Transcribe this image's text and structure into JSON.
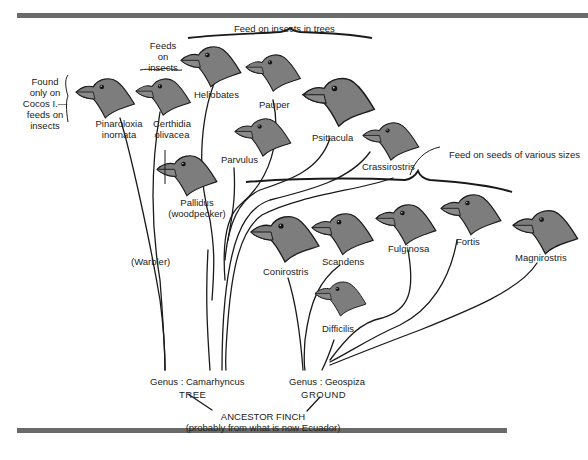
{
  "diagram": {
    "annotations": {
      "cocos": [
        "Found",
        "only on",
        "Cocos I.—",
        "feeds on",
        "insects"
      ],
      "feeds_on_insects": [
        "Feeds",
        "on",
        "insects"
      ],
      "insects_in_trees": "Feed on insects in trees",
      "seeds": "Feed on seeds of various sizes"
    },
    "species": [
      {
        "id": "pinaroloxia",
        "label": [
          "Pinaroloxia",
          "inornata"
        ]
      },
      {
        "id": "certhidia",
        "label": [
          "Certhidia",
          "olivacea"
        ]
      },
      {
        "id": "heliobates",
        "label": [
          "Heliobates"
        ]
      },
      {
        "id": "pauper",
        "label": [
          "Pauper"
        ]
      },
      {
        "id": "parvulus",
        "label": [
          "Parvulus"
        ]
      },
      {
        "id": "psittacula",
        "label": [
          "Psittacula"
        ]
      },
      {
        "id": "crassirostris",
        "label": [
          "Crassirostris"
        ]
      },
      {
        "id": "pallidus",
        "label": [
          "Pallidus",
          "(woodpecker)"
        ]
      },
      {
        "id": "conirostris",
        "label": [
          "Conirostris"
        ]
      },
      {
        "id": "scandens",
        "label": [
          "Scandens"
        ]
      },
      {
        "id": "fulginosa",
        "label": [
          "Fulginosa"
        ]
      },
      {
        "id": "fortis",
        "label": [
          "Fortis"
        ]
      },
      {
        "id": "magnirostris",
        "label": [
          "Magnirostris"
        ]
      },
      {
        "id": "difficilis",
        "label": [
          "Difficilis"
        ]
      }
    ],
    "groups": {
      "warbler": "(Warbler)",
      "camarhyncus": "Genus : Camarhyncus",
      "tree": "TREE",
      "geospiza": "Genus : Geospiza",
      "ground": "GROUND"
    },
    "root": {
      "label": "ANCESTOR FINCH",
      "sublabel": "(probably from what is now Ecuador)"
    },
    "colors": {
      "bird_fill": "#7d7d7d",
      "outline": "#1a1a1a",
      "rule": "#6a6a6a"
    }
  }
}
